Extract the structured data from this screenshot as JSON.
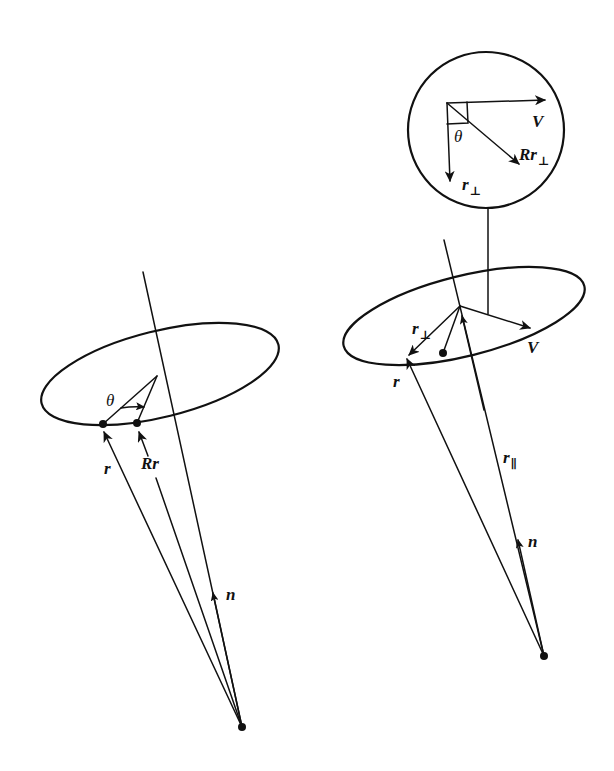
{
  "figure": {
    "left_panel": {
      "labels": {
        "theta": "θ",
        "r": "r",
        "rotated_r": "Rr",
        "n": "n"
      }
    },
    "right_panel": {
      "labels": {
        "r_perp": "r",
        "r_perp_sub": "⊥",
        "r": "r",
        "v": "V",
        "r_parallel": "r",
        "r_parallel_sub": "∥",
        "n": "n"
      },
      "inset": {
        "labels": {
          "v": "V",
          "theta": "θ",
          "rotated_r_perp": "Rr",
          "rotated_r_perp_sub": "⊥",
          "r_perp": "r",
          "r_perp_sub": "⊥"
        }
      }
    },
    "colors": {
      "ink": "#111111",
      "background": "#ffffff"
    }
  }
}
